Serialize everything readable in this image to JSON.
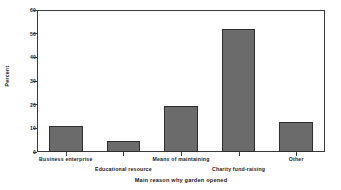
{
  "chart_data": {
    "type": "bar",
    "title": "",
    "xlabel": "Main reason why garden opened",
    "ylabel": "Percent",
    "categories": [
      "Business enterprise",
      "Educational resource",
      "Means of maintaining",
      "Charity fund-raising",
      "Other"
    ],
    "values": [
      11,
      4.5,
      19.5,
      52,
      12.5
    ],
    "ylim": [
      0,
      60
    ],
    "yticks": [
      0,
      10,
      20,
      30,
      40,
      50,
      60
    ],
    "ytick_labels": [
      "0",
      "10",
      "20",
      "30",
      "40",
      "50",
      "60"
    ],
    "grid": false,
    "legend": false,
    "bar_color": "#6b6b6b",
    "bar_border_color": "#2e2e2e",
    "axis_color": "#3a3a3a",
    "background_color": "#ffffff",
    "label_stagger": [
      "top",
      "bottom",
      "top",
      "bottom",
      "top"
    ]
  }
}
